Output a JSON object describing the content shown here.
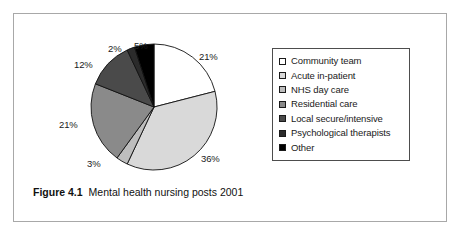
{
  "figure": {
    "caption_label": "Figure 4.1",
    "caption_text": "Mental health nursing posts 2001"
  },
  "legend": {
    "items": [
      {
        "label": "Community team",
        "color": "#ffffff"
      },
      {
        "label": "Acute in-patient",
        "color": "#d9d9d9"
      },
      {
        "label": "NHS day care",
        "color": "#bdbdbd"
      },
      {
        "label": "Residential care",
        "color": "#8a8a8a"
      },
      {
        "label": "Local secure/intensive",
        "color": "#4a4a4a"
      },
      {
        "label": "Psychological therapists",
        "color": "#2b2b2b"
      },
      {
        "label": "Other",
        "color": "#000000"
      }
    ]
  },
  "labels": {
    "l0": "21%",
    "l1": "36%",
    "l2": "3%",
    "l3": "21%",
    "l4": "12%",
    "l5": "2%",
    "l6": "5%"
  },
  "chart_data": {
    "type": "pie",
    "title": "Mental health nursing posts 2001",
    "categories": [
      "Community team",
      "Acute in-patient",
      "NHS day care",
      "Residential care",
      "Local secure/intensive",
      "Psychological therapists",
      "Other"
    ],
    "values": [
      21,
      36,
      3,
      21,
      12,
      2,
      5
    ],
    "value_labels": [
      "21%",
      "36%",
      "3%",
      "21%",
      "12%",
      "2%",
      "5%"
    ],
    "unit": "percent",
    "total": 100,
    "colors": [
      "#ffffff",
      "#d9d9d9",
      "#bdbdbd",
      "#8a8a8a",
      "#4a4a4a",
      "#2b2b2b",
      "#000000"
    ],
    "start_angle_deg": 0,
    "direction": "clockwise",
    "legend_position": "right",
    "grid": false,
    "xlabel": "",
    "ylabel": ""
  }
}
